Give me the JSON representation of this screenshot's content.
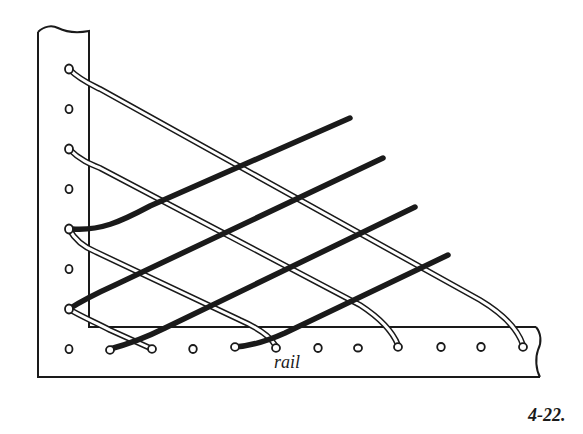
{
  "figure": {
    "number": "4-22.",
    "labels": {
      "rail": "rail"
    },
    "colors": {
      "ink": "#1a1a1a",
      "paper": "#ffffff"
    },
    "post": {
      "holes_y": [
        69,
        109,
        149,
        189,
        229,
        269,
        309,
        349
      ],
      "hole_x": 69
    },
    "rail": {
      "holes_x": [
        69,
        110,
        150,
        190,
        235,
        275,
        318,
        358,
        398,
        440,
        480,
        523
      ],
      "hole_y": 348
    },
    "white_strings": [
      {
        "from": [
          69,
          69
        ],
        "to": [
          523,
          345
        ]
      },
      {
        "from": [
          69,
          149
        ],
        "to": [
          398,
          345
        ]
      },
      {
        "from": [
          69,
          229
        ],
        "to": [
          275,
          345
        ]
      },
      {
        "from": [
          69,
          309
        ],
        "to": [
          150,
          348
        ]
      }
    ],
    "black_strings": [
      {
        "from": [
          75,
          229
        ],
        "to": [
          350,
          118
        ]
      },
      {
        "from": [
          69,
          309
        ],
        "to": [
          383,
          157
        ]
      },
      {
        "from": [
          110,
          350
        ],
        "to": [
          415,
          207
        ]
      },
      {
        "from": [
          235,
          348
        ],
        "to": [
          448,
          255
        ]
      }
    ]
  }
}
